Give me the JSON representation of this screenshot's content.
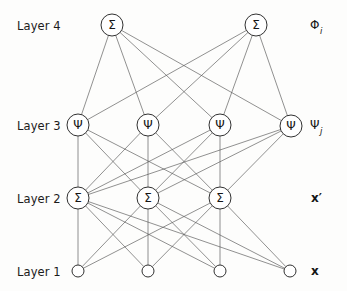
{
  "figure": {
    "background_color": "#fdfdfc",
    "edge_color": "#555555",
    "node_stroke_color": "#1a1a1a",
    "node_fill_color": "#ffffff",
    "text_color": "#161616"
  },
  "layer_labels": [
    {
      "id": "layer4",
      "text": "Layer 4",
      "x": 17,
      "y": 19
    },
    {
      "id": "layer3",
      "text": "Layer 3",
      "x": 17,
      "y": 119
    },
    {
      "id": "layer2",
      "text": "Layer 2",
      "x": 17,
      "y": 192
    },
    {
      "id": "layer1",
      "text": "Layer 1",
      "x": 17,
      "y": 265
    }
  ],
  "variable_labels": [
    {
      "id": "phi-i",
      "base": "Φ",
      "sub": "i",
      "bold": false,
      "x": 310,
      "y": 18
    },
    {
      "id": "psi-j",
      "base": "Ψ",
      "sub": "j",
      "bold": false,
      "x": 310,
      "y": 118
    },
    {
      "id": "x-prime",
      "base": "x",
      "sub": "",
      "prime": "′",
      "bold": true,
      "x": 311,
      "y": 191
    },
    {
      "id": "x-input",
      "base": "x",
      "sub": "",
      "prime": "",
      "bold": true,
      "x": 311,
      "y": 264
    }
  ],
  "chart_data": {
    "type": "diagram",
    "diagram_kind": "neural-network-graph",
    "layers": [
      {
        "index": 1,
        "name": "Layer 1",
        "role": "input",
        "glyph": "",
        "node_radius": 6,
        "y": 271,
        "output_symbol": "x",
        "nodes": [
          {
            "id": "L1N1",
            "x": 78,
            "y": 271,
            "label": ""
          },
          {
            "id": "L1N2",
            "x": 148,
            "y": 271,
            "label": ""
          },
          {
            "id": "L1N3",
            "x": 220,
            "y": 271,
            "label": ""
          },
          {
            "id": "L1N4",
            "x": 290,
            "y": 271,
            "label": ""
          }
        ]
      },
      {
        "index": 2,
        "name": "Layer 2",
        "role": "summation",
        "glyph": "Σ",
        "node_radius": 11,
        "y": 198,
        "output_symbol": "x′",
        "nodes": [
          {
            "id": "L2N1",
            "x": 78,
            "y": 198,
            "label": "Σ"
          },
          {
            "id": "L2N2",
            "x": 148,
            "y": 198,
            "label": "Σ"
          },
          {
            "id": "L2N3",
            "x": 220,
            "y": 198,
            "label": "Σ"
          }
        ]
      },
      {
        "index": 3,
        "name": "Layer 3",
        "role": "basis-function",
        "glyph": "Ψ",
        "node_radius": 11,
        "y": 125,
        "output_symbol": "Ψ_j",
        "nodes": [
          {
            "id": "L3N1",
            "x": 78,
            "y": 125,
            "label": "Ψ"
          },
          {
            "id": "L3N2",
            "x": 148,
            "y": 125,
            "label": "Ψ"
          },
          {
            "id": "L3N3",
            "x": 220,
            "y": 125,
            "label": "Ψ"
          },
          {
            "id": "L3N4",
            "x": 291,
            "y": 126,
            "label": "Ψ"
          }
        ]
      },
      {
        "index": 4,
        "name": "Layer 4",
        "role": "summation-output",
        "glyph": "Σ",
        "node_radius": 11,
        "y": 25,
        "output_symbol": "Φ_i",
        "nodes": [
          {
            "id": "L4N1",
            "x": 112,
            "y": 25,
            "label": "Σ"
          },
          {
            "id": "L4N2",
            "x": 256,
            "y": 25,
            "label": "Σ"
          }
        ]
      }
    ],
    "connections": [
      {
        "from": "L1N1",
        "to": "L2N1"
      },
      {
        "from": "L1N1",
        "to": "L2N2"
      },
      {
        "from": "L1N1",
        "to": "L2N3"
      },
      {
        "from": "L1N2",
        "to": "L2N1"
      },
      {
        "from": "L1N2",
        "to": "L2N2"
      },
      {
        "from": "L1N2",
        "to": "L2N3"
      },
      {
        "from": "L1N3",
        "to": "L2N1"
      },
      {
        "from": "L1N3",
        "to": "L2N2"
      },
      {
        "from": "L1N3",
        "to": "L2N3"
      },
      {
        "from": "L1N4",
        "to": "L2N1"
      },
      {
        "from": "L1N4",
        "to": "L2N2"
      },
      {
        "from": "L1N4",
        "to": "L2N3"
      },
      {
        "from": "L2N1",
        "to": "L3N1"
      },
      {
        "from": "L2N1",
        "to": "L3N2"
      },
      {
        "from": "L2N1",
        "to": "L3N3"
      },
      {
        "from": "L2N1",
        "to": "L3N4"
      },
      {
        "from": "L2N2",
        "to": "L3N1"
      },
      {
        "from": "L2N2",
        "to": "L3N2"
      },
      {
        "from": "L2N2",
        "to": "L3N3"
      },
      {
        "from": "L2N2",
        "to": "L3N4"
      },
      {
        "from": "L2N3",
        "to": "L3N1"
      },
      {
        "from": "L2N3",
        "to": "L3N2"
      },
      {
        "from": "L2N3",
        "to": "L3N3"
      },
      {
        "from": "L2N3",
        "to": "L3N4"
      },
      {
        "from": "L3N1",
        "to": "L4N1"
      },
      {
        "from": "L3N1",
        "to": "L4N2"
      },
      {
        "from": "L3N2",
        "to": "L4N1"
      },
      {
        "from": "L3N2",
        "to": "L4N2"
      },
      {
        "from": "L3N3",
        "to": "L4N1"
      },
      {
        "from": "L3N3",
        "to": "L4N2"
      },
      {
        "from": "L3N4",
        "to": "L4N1"
      },
      {
        "from": "L3N4",
        "to": "L4N2"
      }
    ],
    "connection_pattern": "fully-connected between adjacent layers",
    "edge_counts": {
      "layer1_to_layer2": 12,
      "layer2_to_layer3": 12,
      "layer3_to_layer4": 8
    }
  }
}
